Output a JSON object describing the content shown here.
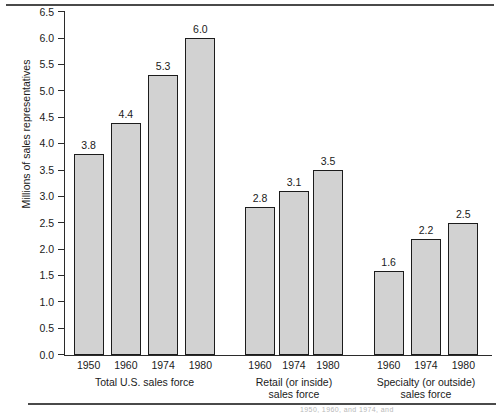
{
  "chart_data": {
    "type": "bar",
    "title": "",
    "xlabel": "",
    "ylabel": "Millions of sales representatives",
    "ylim": [
      0.0,
      6.5
    ],
    "yticks": [
      "0.0",
      "0.5",
      "1.0",
      "1.5",
      "2.0",
      "2.5",
      "3.0",
      "3.5",
      "4.0",
      "4.5",
      "5.0",
      "5.5",
      "6.0",
      "6.5"
    ],
    "grid": false,
    "legend": "none",
    "groups": [
      {
        "label_line1": "Total U.S. sales force",
        "label_line2": "",
        "categories": [
          "1950",
          "1960",
          "1974",
          "1980"
        ],
        "values": [
          3.8,
          4.4,
          5.3,
          6.0
        ],
        "value_labels": [
          "3.8",
          "4.4",
          "5.3",
          "6.0"
        ]
      },
      {
        "label_line1": "Retail (or inside)",
        "label_line2": "sales force",
        "categories": [
          "1960",
          "1974",
          "1980"
        ],
        "values": [
          2.8,
          3.1,
          3.5
        ],
        "value_labels": [
          "2.8",
          "3.1",
          "3.5"
        ]
      },
      {
        "label_line1": "Specialty (or outside)",
        "label_line2": "sales force",
        "categories": [
          "1960",
          "1974",
          "1980"
        ],
        "values": [
          1.6,
          2.2,
          2.5
        ],
        "value_labels": [
          "1.6",
          "2.2",
          "2.5"
        ]
      }
    ],
    "colors": {
      "bar_fill": "#d2d2d2",
      "bar_edge": "#1c1c1c",
      "axis": "#2b2b2b",
      "text": "#1a1a1a",
      "rule": "#4a4a4a"
    }
  },
  "footer": {
    "cut_off_caption": "1950, 1960, and 1974, and"
  }
}
